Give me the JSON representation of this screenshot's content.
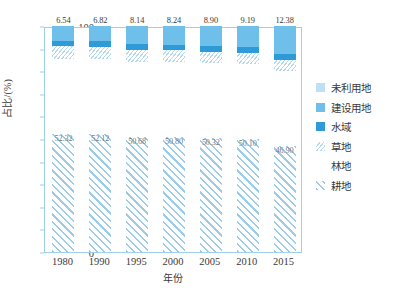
{
  "chart_data": {
    "type": "bar",
    "stacked": true,
    "title": "",
    "xlabel": "年份",
    "ylabel": "占比/(%)",
    "ylim": [
      0,
      100
    ],
    "ytick_step": 10,
    "yticks": [
      "0",
      "10",
      "20",
      "30",
      "40",
      "50",
      "60",
      "70",
      "80",
      "90",
      "100"
    ],
    "categories": [
      "1980",
      "1990",
      "1995",
      "2000",
      "2005",
      "2010",
      "2015"
    ],
    "grid": false,
    "legend_position": "right",
    "series": [
      {
        "name": "耕地",
        "pattern": "diagonal-hatch",
        "color": "#9ecbe8",
        "values": [
          52.32,
          52.12,
          50.68,
          50.8,
          50.32,
          50.1,
          46.9
        ],
        "labels": [
          "52.32",
          "52.12",
          "50.68",
          "50.80",
          "50.32",
          "50.10",
          "46.90"
        ]
      },
      {
        "name": "林地",
        "pattern": "dotted",
        "color": "#bedcf0",
        "values": [
          33.2,
          33.25,
          33.45,
          33.2,
          33.1,
          32.95,
          33.1
        ]
      },
      {
        "name": "草地",
        "pattern": "small-dash",
        "color": "#b6d8ef",
        "values": [
          5.6,
          5.45,
          5.35,
          5.3,
          5.25,
          5.2,
          5.15
        ]
      },
      {
        "name": "水域",
        "pattern": "solid",
        "color": "#2e9bd8",
        "values": [
          2.34,
          2.36,
          2.38,
          2.46,
          2.43,
          2.56,
          2.47
        ]
      },
      {
        "name": "建设用地",
        "pattern": "solid",
        "color": "#6ec0ea",
        "values": [
          6.54,
          6.82,
          8.14,
          8.24,
          8.9,
          9.19,
          12.38
        ],
        "labels": [
          "6.54",
          "6.82",
          "8.14",
          "8.24",
          "8.90",
          "9.19",
          "12.38"
        ]
      },
      {
        "name": "未利用地",
        "pattern": "solid",
        "color": "#bfe0f4",
        "values": [
          0.0,
          0.0,
          0.0,
          0.0,
          0.0,
          0.0,
          0.0
        ]
      }
    ]
  },
  "legend": {
    "items": [
      {
        "label": "未利用地",
        "swatch_class": "sw-weiliyong",
        "icon": "legend-swatch-unused-land"
      },
      {
        "label": "建设用地",
        "swatch_class": "sw-jianshe",
        "icon": "legend-swatch-built-land"
      },
      {
        "label": "水域",
        "swatch_class": "sw-shuiyu",
        "icon": "legend-swatch-water"
      },
      {
        "label": "草地",
        "swatch_class": "sw-caodi",
        "icon": "legend-swatch-grassland"
      },
      {
        "label": "林地",
        "swatch_class": "sw-lindi",
        "icon": "legend-swatch-forest"
      },
      {
        "label": "耕地",
        "swatch_class": "sw-gengdi",
        "icon": "legend-swatch-cropland"
      }
    ]
  },
  "axes": {
    "y_title": "占比/(%)",
    "x_title": "年份"
  }
}
